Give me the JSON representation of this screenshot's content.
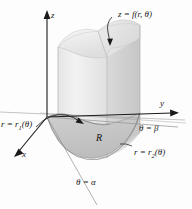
{
  "figure": {
    "background_color": "#fdfdfd",
    "line_color": "#1a1a1a"
  },
  "axes": {
    "z_label": "z",
    "y_label": "y",
    "x_label": "x"
  },
  "labels": {
    "surface": "z = f(r, θ)",
    "inner_radius": "r = r",
    "inner_radius_sub": "1",
    "inner_radius_arg": "(θ)",
    "outer_radius": "r = r",
    "outer_radius_sub": "2",
    "outer_radius_arg": "(θ)",
    "theta_start": "θ = α",
    "theta_end": "θ = β",
    "region": "R"
  },
  "colors": {
    "surface_top_light": "#f2f2f2",
    "surface_top_mid": "#e2e2e2",
    "wall_front": "#ebebeb",
    "wall_right": "#d2d2d2",
    "wall_left": "#dcdcdc",
    "region_fill": "#c9c9c9",
    "outline": "#4a4a4a",
    "axis": "#1a1a1a"
  }
}
